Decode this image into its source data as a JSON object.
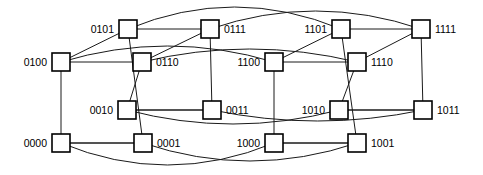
{
  "figure": {
    "kind": "graph-diagram",
    "width": 483,
    "height": 175,
    "background_color": "#ffffff",
    "node_stroke_color": "#000000",
    "node_fill_color": "#ffffff",
    "edge_color": "#1a1a1a",
    "node_shape": "square",
    "node_size": 18
  },
  "nodes": [
    {
      "id": "0101",
      "label": "0101",
      "x": 128,
      "y": 29,
      "label_side": "left"
    },
    {
      "id": "0111",
      "label": "0111",
      "x": 210,
      "y": 29,
      "label_side": "right"
    },
    {
      "id": "1101",
      "label": "1101",
      "x": 341,
      "y": 29,
      "label_side": "left"
    },
    {
      "id": "1111",
      "label": "1111",
      "x": 421,
      "y": 29,
      "label_side": "right"
    },
    {
      "id": "0100",
      "label": "0100",
      "x": 61,
      "y": 62,
      "label_side": "left"
    },
    {
      "id": "0110",
      "label": "0110",
      "x": 142,
      "y": 62,
      "label_side": "right"
    },
    {
      "id": "1100",
      "label": "1100",
      "x": 274,
      "y": 62,
      "label_side": "left"
    },
    {
      "id": "1110",
      "label": "1110",
      "x": 357,
      "y": 62,
      "label_side": "right"
    },
    {
      "id": "0010",
      "label": "0010",
      "x": 127,
      "y": 110,
      "label_side": "left"
    },
    {
      "id": "0011",
      "label": "0011",
      "x": 212,
      "y": 110,
      "label_side": "right"
    },
    {
      "id": "1010",
      "label": "1010",
      "x": 339,
      "y": 110,
      "label_side": "left"
    },
    {
      "id": "1011",
      "label": "1011",
      "x": 423,
      "y": 110,
      "label_side": "right"
    },
    {
      "id": "0000",
      "label": "0000",
      "x": 61,
      "y": 143,
      "label_side": "left"
    },
    {
      "id": "0001",
      "label": "0001",
      "x": 143,
      "y": 143,
      "label_side": "right"
    },
    {
      "id": "1000",
      "label": "1000",
      "x": 274,
      "y": 143,
      "label_side": "left"
    },
    {
      "id": "1001",
      "label": "1001",
      "x": 357,
      "y": 143,
      "label_side": "right"
    }
  ],
  "edges": [
    {
      "from": "0101",
      "to": "0111",
      "type": "line"
    },
    {
      "from": "0100",
      "to": "0110",
      "type": "line"
    },
    {
      "from": "0010",
      "to": "0011",
      "type": "line"
    },
    {
      "from": "0000",
      "to": "0001",
      "type": "line"
    },
    {
      "from": "1101",
      "to": "1111",
      "type": "line"
    },
    {
      "from": "1100",
      "to": "1110",
      "type": "line"
    },
    {
      "from": "1010",
      "to": "1011",
      "type": "line"
    },
    {
      "from": "1000",
      "to": "1001",
      "type": "line"
    },
    {
      "from": "0101",
      "to": "0100",
      "type": "line"
    },
    {
      "from": "0111",
      "to": "0110",
      "type": "line"
    },
    {
      "from": "0011",
      "to": "0010",
      "type": "line"
    },
    {
      "from": "0001",
      "to": "0000",
      "type": "line"
    },
    {
      "from": "1101",
      "to": "1100",
      "type": "line"
    },
    {
      "from": "1111",
      "to": "1110",
      "type": "line"
    },
    {
      "from": "1011",
      "to": "1010",
      "type": "line"
    },
    {
      "from": "1001",
      "to": "1000",
      "type": "line"
    },
    {
      "from": "0101",
      "to": "0001",
      "type": "line"
    },
    {
      "from": "0111",
      "to": "0011",
      "type": "line"
    },
    {
      "from": "0100",
      "to": "0000",
      "type": "line"
    },
    {
      "from": "0110",
      "to": "0010",
      "type": "line"
    },
    {
      "from": "1101",
      "to": "1001",
      "type": "line"
    },
    {
      "from": "1111",
      "to": "1011",
      "type": "line"
    },
    {
      "from": "1100",
      "to": "1000",
      "type": "line"
    },
    {
      "from": "1110",
      "to": "1010",
      "type": "line"
    },
    {
      "from": "0101",
      "to": "1101",
      "type": "arc",
      "curve": -22
    },
    {
      "from": "0111",
      "to": "1111",
      "type": "arc",
      "curve": -18
    },
    {
      "from": "0100",
      "to": "1100",
      "type": "arc",
      "curve": -16
    },
    {
      "from": "0110",
      "to": "1110",
      "type": "arc",
      "curve": -13
    },
    {
      "from": "0010",
      "to": "1010",
      "type": "arc",
      "curve": 14
    },
    {
      "from": "0011",
      "to": "1011",
      "type": "arc",
      "curve": 11
    },
    {
      "from": "0000",
      "to": "1000",
      "type": "arc",
      "curve": 22
    },
    {
      "from": "0001",
      "to": "1001",
      "type": "arc",
      "curve": 18
    }
  ]
}
